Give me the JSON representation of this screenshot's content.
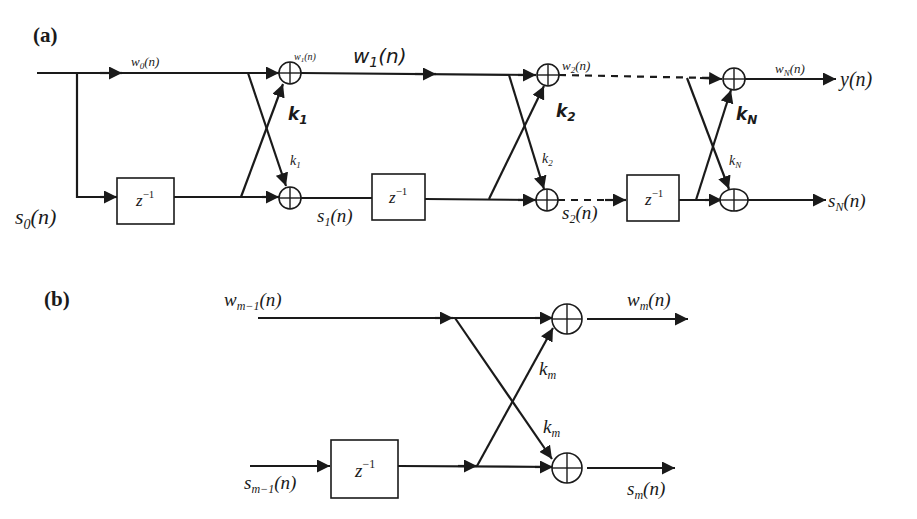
{
  "panel_a": {
    "label": "(a)",
    "input_top": "w",
    "input_top_sub": "0",
    "input_top_arg": "(n)",
    "input_bottom": "s",
    "input_bottom_sub": "0",
    "input_bottom_arg": "(n)",
    "delay_label": "z",
    "delay_exp": "−1",
    "stage1": {
      "w_small": "w",
      "w_small_sub": "1",
      "w_small_arg": "(n)",
      "w_big": "w",
      "w_big_sub": "1",
      "w_big_arg": "(n)",
      "k_top": "k",
      "k_top_sub": "1",
      "k_bottom": "k",
      "k_bottom_sub": "1",
      "s_out": "s",
      "s_out_sub": "1",
      "s_out_arg": "(n)"
    },
    "stage2": {
      "w_out": "w",
      "w_out_sub": "2",
      "w_out_arg": "(n)",
      "k_top": "k",
      "k_top_sub": "2",
      "k_bottom": "k",
      "k_bottom_sub": "2",
      "s_out": "s",
      "s_out_sub": "2",
      "s_out_arg": "(n)"
    },
    "stageN": {
      "w_out": "w",
      "w_out_sub": "N",
      "w_out_arg": "(n)",
      "k_top": "k",
      "k_top_sub": "N",
      "k_bottom": "k",
      "k_bottom_sub": "N",
      "s_out": "s",
      "s_out_sub": "N",
      "s_out_arg": "(n)"
    },
    "output": "y(n)"
  },
  "panel_b": {
    "label": "(b)",
    "w_in": "w",
    "w_in_sub": "m−1",
    "w_in_arg": "(n)",
    "s_in": "s",
    "s_in_sub": "m−1",
    "s_in_arg": "(n)",
    "delay_label": "z",
    "delay_exp": "−1",
    "k_top": "k",
    "k_top_sub": "m",
    "k_bottom": "k",
    "k_bottom_sub": "m",
    "w_out": "w",
    "w_out_sub": "m",
    "w_out_arg": "(n)",
    "s_out": "s",
    "s_out_sub": "m",
    "s_out_arg": "(n)"
  }
}
